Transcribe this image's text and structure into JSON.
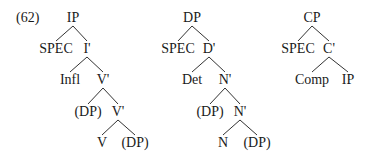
{
  "example_label": "(62)",
  "trees": [
    {
      "name": "IP",
      "nodes": [
        {
          "id": "ip",
          "label": "IP",
          "x": 73,
          "y": 18
        },
        {
          "id": "spec",
          "label": "SPEC",
          "x": 56,
          "y": 49
        },
        {
          "id": "ibar",
          "label": "I'",
          "x": 87,
          "y": 49
        },
        {
          "id": "infl",
          "label": "Infl",
          "x": 70,
          "y": 80
        },
        {
          "id": "vbar1",
          "label": "V'",
          "x": 103,
          "y": 80
        },
        {
          "id": "dp1",
          "label": "(DP)",
          "x": 88,
          "y": 112
        },
        {
          "id": "vbar2",
          "label": "V'",
          "x": 118,
          "y": 112
        },
        {
          "id": "v",
          "label": "V",
          "x": 102,
          "y": 143
        },
        {
          "id": "dp2",
          "label": "(DP)",
          "x": 135,
          "y": 143
        }
      ],
      "edges": [
        [
          "ip",
          "spec"
        ],
        [
          "ip",
          "ibar"
        ],
        [
          "ibar",
          "infl"
        ],
        [
          "ibar",
          "vbar1"
        ],
        [
          "vbar1",
          "dp1"
        ],
        [
          "vbar1",
          "vbar2"
        ],
        [
          "vbar2",
          "v"
        ],
        [
          "vbar2",
          "dp2"
        ]
      ]
    },
    {
      "name": "DP",
      "nodes": [
        {
          "id": "dp",
          "label": "DP",
          "x": 192,
          "y": 18
        },
        {
          "id": "spec",
          "label": "SPEC",
          "x": 178,
          "y": 49
        },
        {
          "id": "dbar",
          "label": "D'",
          "x": 209,
          "y": 49
        },
        {
          "id": "det",
          "label": "Det",
          "x": 192,
          "y": 80
        },
        {
          "id": "nbar1",
          "label": "N'",
          "x": 225,
          "y": 80
        },
        {
          "id": "dp1",
          "label": "(DP)",
          "x": 210,
          "y": 112
        },
        {
          "id": "nbar2",
          "label": "N'",
          "x": 240,
          "y": 112
        },
        {
          "id": "n",
          "label": "N",
          "x": 223,
          "y": 143
        },
        {
          "id": "dp2",
          "label": "(DP)",
          "x": 257,
          "y": 143
        }
      ],
      "edges": [
        [
          "dp",
          "spec"
        ],
        [
          "dp",
          "dbar"
        ],
        [
          "dbar",
          "det"
        ],
        [
          "dbar",
          "nbar1"
        ],
        [
          "nbar1",
          "dp1"
        ],
        [
          "nbar1",
          "nbar2"
        ],
        [
          "nbar2",
          "n"
        ],
        [
          "nbar2",
          "dp2"
        ]
      ]
    },
    {
      "name": "CP",
      "nodes": [
        {
          "id": "cp",
          "label": "CP",
          "x": 312,
          "y": 18
        },
        {
          "id": "spec",
          "label": "SPEC",
          "x": 298,
          "y": 49
        },
        {
          "id": "cbar",
          "label": "C'",
          "x": 329,
          "y": 49
        },
        {
          "id": "comp",
          "label": "Comp",
          "x": 312,
          "y": 80
        },
        {
          "id": "ip",
          "label": "IP",
          "x": 348,
          "y": 80
        }
      ],
      "edges": [
        [
          "cp",
          "spec"
        ],
        [
          "cp",
          "cbar"
        ],
        [
          "cbar",
          "comp"
        ],
        [
          "cbar",
          "ip"
        ]
      ]
    }
  ]
}
